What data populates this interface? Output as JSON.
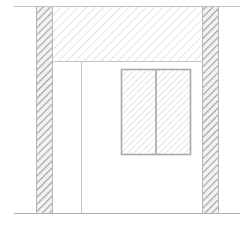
{
  "diagram": {
    "type": "architectural-elevation",
    "elements": {
      "top_line": {
        "x1": 14,
        "x2": 240,
        "y": 6
      },
      "ground_line": {
        "x1": 14,
        "x2": 240,
        "y": 213
      },
      "left_column": {
        "x": 36,
        "y": 6,
        "width": 17,
        "height": 207
      },
      "right_column": {
        "x": 202,
        "y": 6,
        "width": 17,
        "height": 207
      },
      "beam": {
        "x": 53,
        "y": 6,
        "width": 149,
        "height": 55
      },
      "interior_line": {
        "x": 81,
        "y1": 61,
        "y2": 213
      },
      "window": {
        "x": 121,
        "y": 69,
        "width": 70,
        "height": 86,
        "divider_x": 156
      }
    },
    "colors": {
      "line": "#b8b8b8",
      "column_hatch": "#a0a0a0",
      "beam_hatch": "#c4c4c4",
      "window_frame": "#a8a8a8"
    }
  }
}
